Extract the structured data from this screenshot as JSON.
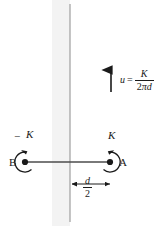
{
  "figure": {
    "width": 167,
    "height": 226,
    "background_color": "#ffffff",
    "line_color": "#4d4d4d",
    "ink_color": "#1a1a1a",
    "wall": {
      "name": "wall",
      "fill_color": "#f2f2f2",
      "edge_color": "#999999",
      "x_left": 52,
      "x_right": 70
    },
    "velocity_arrow": {
      "name": "induced-velocity-arrow",
      "direction": "up",
      "x": 111,
      "y_top": 68,
      "y_bottom": 92
    },
    "equation": {
      "variable": "u",
      "equals": "=",
      "numerator": "K",
      "denominator_two": "2",
      "denominator_pi": "π",
      "denominator_d": "d"
    },
    "vortex_a": {
      "name": "vortex-a",
      "label": "A",
      "strength_label": "K",
      "sign": "+",
      "rotation": "clockwise",
      "cx": 110,
      "cy": 162,
      "r": 10
    },
    "vortex_b": {
      "name": "vortex-b",
      "label": "B",
      "strength_label": "K",
      "sign": "−",
      "rotation": "counterclockwise",
      "cx": 25,
      "cy": 162,
      "r": 10
    },
    "connector_line": {
      "name": "vortex-connector-line",
      "x1": 25,
      "x2": 110,
      "y": 162
    },
    "dimension": {
      "name": "spacing-dimension",
      "numerator": "d",
      "denominator": "2",
      "x_left": 70,
      "x_right": 112,
      "y": 184
    }
  }
}
